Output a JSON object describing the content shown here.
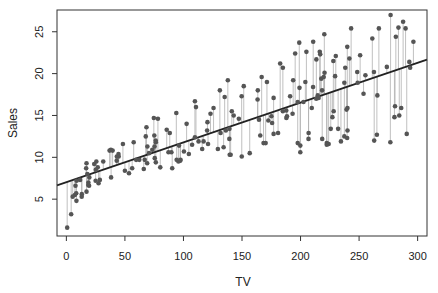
{
  "chart_data": {
    "type": "scatter",
    "title": "",
    "xlabel": "TV",
    "ylabel": "Sales",
    "xlim": [
      -8,
      308
    ],
    "ylim": [
      0.6,
      27.6
    ],
    "xticks": [
      0,
      50,
      100,
      150,
      200,
      250,
      300
    ],
    "yticks": [
      5,
      10,
      15,
      20,
      25
    ],
    "grid": false,
    "legend": null,
    "regression_line": {
      "intercept": 7.03,
      "slope": 0.0475
    },
    "show_residuals": true,
    "colors": {
      "point": "#555555",
      "line": "#222222",
      "residual": "#b0b0b0",
      "frame": "#333333"
    },
    "points": [
      [
        230.1,
        22.1
      ],
      [
        44.5,
        10.4
      ],
      [
        17.2,
        9.3
      ],
      [
        151.5,
        18.5
      ],
      [
        180.8,
        12.9
      ],
      [
        8.7,
        7.2
      ],
      [
        57.5,
        11.8
      ],
      [
        120.2,
        13.2
      ],
      [
        8.6,
        4.8
      ],
      [
        199.8,
        10.6
      ],
      [
        66.1,
        8.6
      ],
      [
        214.7,
        17.4
      ],
      [
        23.8,
        9.2
      ],
      [
        97.5,
        9.7
      ],
      [
        204.1,
        19.0
      ],
      [
        195.4,
        22.4
      ],
      [
        67.8,
        12.5
      ],
      [
        281.4,
        24.4
      ],
      [
        69.2,
        11.3
      ],
      [
        147.3,
        14.6
      ],
      [
        218.4,
        18.0
      ],
      [
        237.4,
        12.5
      ],
      [
        13.2,
        5.6
      ],
      [
        228.3,
        15.5
      ],
      [
        62.3,
        9.7
      ],
      [
        262.9,
        12.0
      ],
      [
        142.9,
        15.0
      ],
      [
        240.1,
        15.9
      ],
      [
        248.8,
        18.9
      ],
      [
        70.6,
        10.5
      ],
      [
        292.9,
        21.4
      ],
      [
        112.9,
        11.9
      ],
      [
        97.2,
        9.6
      ],
      [
        265.6,
        17.4
      ],
      [
        95.7,
        9.5
      ],
      [
        290.7,
        12.8
      ],
      [
        266.9,
        25.4
      ],
      [
        74.7,
        14.7
      ],
      [
        43.1,
        10.1
      ],
      [
        228.0,
        21.5
      ],
      [
        202.5,
        16.6
      ],
      [
        177.0,
        17.1
      ],
      [
        293.6,
        20.7
      ],
      [
        206.9,
        12.9
      ],
      [
        25.1,
        8.5
      ],
      [
        175.1,
        14.9
      ],
      [
        89.7,
        10.6
      ],
      [
        239.9,
        23.2
      ],
      [
        227.2,
        14.8
      ],
      [
        66.9,
        9.7
      ],
      [
        199.8,
        11.4
      ],
      [
        100.4,
        10.7
      ],
      [
        216.4,
        22.6
      ],
      [
        182.6,
        21.2
      ],
      [
        262.7,
        20.2
      ],
      [
        198.9,
        23.7
      ],
      [
        7.3,
        5.5
      ],
      [
        136.2,
        13.2
      ],
      [
        210.8,
        23.8
      ],
      [
        210.7,
        18.4
      ],
      [
        53.5,
        8.1
      ],
      [
        261.3,
        24.2
      ],
      [
        239.3,
        15.7
      ],
      [
        102.7,
        14.0
      ],
      [
        131.1,
        18.0
      ],
      [
        69.0,
        9.3
      ],
      [
        31.5,
        9.5
      ],
      [
        139.3,
        13.4
      ],
      [
        237.4,
        18.9
      ],
      [
        216.8,
        22.3
      ],
      [
        199.1,
        18.3
      ],
      [
        109.8,
        12.4
      ],
      [
        26.8,
        8.8
      ],
      [
        129.4,
        11.0
      ],
      [
        213.4,
        17.0
      ],
      [
        16.9,
        8.7
      ],
      [
        27.5,
        6.9
      ],
      [
        120.5,
        14.2
      ],
      [
        5.4,
        5.3
      ],
      [
        116.0,
        11.0
      ],
      [
        76.4,
        11.8
      ],
      [
        239.8,
        12.3
      ],
      [
        75.3,
        11.3
      ],
      [
        68.4,
        13.6
      ],
      [
        213.5,
        21.7
      ],
      [
        193.2,
        15.2
      ],
      [
        76.3,
        12.0
      ],
      [
        110.7,
        16.0
      ],
      [
        88.3,
        12.9
      ],
      [
        109.8,
        16.7
      ],
      [
        134.3,
        11.2
      ],
      [
        28.6,
        7.3
      ],
      [
        217.7,
        19.4
      ],
      [
        250.9,
        22.2
      ],
      [
        107.4,
        11.5
      ],
      [
        163.3,
        16.9
      ],
      [
        197.6,
        11.7
      ],
      [
        184.9,
        15.5
      ],
      [
        289.7,
        25.4
      ],
      [
        135.2,
        17.2
      ],
      [
        222.4,
        11.7
      ],
      [
        296.4,
        23.8
      ],
      [
        280.2,
        14.8
      ],
      [
        187.9,
        14.7
      ],
      [
        238.2,
        20.7
      ],
      [
        137.9,
        19.2
      ],
      [
        25.0,
        7.2
      ],
      [
        90.4,
        8.7
      ],
      [
        13.1,
        5.3
      ],
      [
        255.4,
        19.8
      ],
      [
        225.8,
        13.4
      ],
      [
        241.7,
        21.8
      ],
      [
        175.7,
        14.1
      ],
      [
        209.6,
        15.9
      ],
      [
        78.2,
        14.6
      ],
      [
        75.1,
        12.6
      ],
      [
        139.2,
        12.2
      ],
      [
        76.4,
        9.4
      ],
      [
        125.7,
        15.9
      ],
      [
        19.4,
        6.6
      ],
      [
        141.3,
        15.5
      ],
      [
        18.8,
        7.0
      ],
      [
        224.0,
        11.6
      ],
      [
        123.1,
        15.2
      ],
      [
        229.5,
        19.7
      ],
      [
        87.2,
        10.6
      ],
      [
        7.8,
        6.6
      ],
      [
        80.2,
        8.8
      ],
      [
        220.3,
        24.7
      ],
      [
        59.6,
        9.7
      ],
      [
        0.7,
        1.6
      ],
      [
        265.2,
        12.7
      ],
      [
        8.4,
        5.7
      ],
      [
        219.8,
        19.6
      ],
      [
        36.9,
        10.8
      ],
      [
        48.3,
        11.6
      ],
      [
        25.6,
        9.5
      ],
      [
        273.7,
        20.8
      ],
      [
        43.0,
        9.6
      ],
      [
        184.9,
        20.7
      ],
      [
        73.4,
        10.9
      ],
      [
        193.7,
        19.2
      ],
      [
        220.5,
        20.1
      ],
      [
        104.6,
        10.4
      ],
      [
        96.2,
        11.4
      ],
      [
        140.3,
        10.3
      ],
      [
        240.1,
        13.2
      ],
      [
        243.2,
        25.4
      ],
      [
        38.0,
        10.9
      ],
      [
        44.7,
        10.1
      ],
      [
        280.7,
        16.1
      ],
      [
        121.0,
        11.6
      ],
      [
        197.6,
        16.6
      ],
      [
        171.3,
        19.0
      ],
      [
        187.8,
        15.6
      ],
      [
        4.1,
        3.2
      ],
      [
        93.9,
        15.3
      ],
      [
        149.8,
        10.1
      ],
      [
        11.7,
        7.3
      ],
      [
        131.7,
        12.9
      ],
      [
        172.5,
        14.4
      ],
      [
        85.7,
        13.3
      ],
      [
        188.4,
        14.9
      ],
      [
        163.5,
        18.0
      ],
      [
        117.2,
        11.9
      ],
      [
        234.5,
        11.9
      ],
      [
        17.9,
        8.0
      ],
      [
        206.8,
        12.2
      ],
      [
        215.4,
        17.1
      ],
      [
        284.3,
        15.0
      ],
      [
        50.0,
        8.4
      ],
      [
        164.5,
        14.5
      ],
      [
        19.6,
        7.6
      ],
      [
        168.4,
        11.7
      ],
      [
        222.4,
        11.5
      ],
      [
        276.9,
        27.0
      ],
      [
        248.4,
        20.2
      ],
      [
        170.2,
        11.7
      ],
      [
        276.7,
        11.8
      ],
      [
        165.6,
        12.6
      ],
      [
        156.6,
        10.5
      ],
      [
        218.5,
        12.2
      ],
      [
        56.2,
        8.7
      ],
      [
        287.6,
        26.2
      ],
      [
        253.8,
        17.6
      ],
      [
        205.0,
        22.6
      ],
      [
        139.5,
        10.3
      ],
      [
        191.1,
        17.3
      ],
      [
        286.0,
        15.9
      ],
      [
        18.7,
        6.7
      ],
      [
        39.5,
        10.8
      ],
      [
        75.5,
        9.9
      ],
      [
        17.2,
        5.9
      ],
      [
        166.8,
        19.6
      ],
      [
        149.7,
        17.3
      ],
      [
        38.2,
        7.6
      ],
      [
        94.2,
        9.7
      ],
      [
        177.0,
        12.8
      ],
      [
        283.6,
        25.5
      ],
      [
        232.1,
        13.4
      ]
    ]
  }
}
